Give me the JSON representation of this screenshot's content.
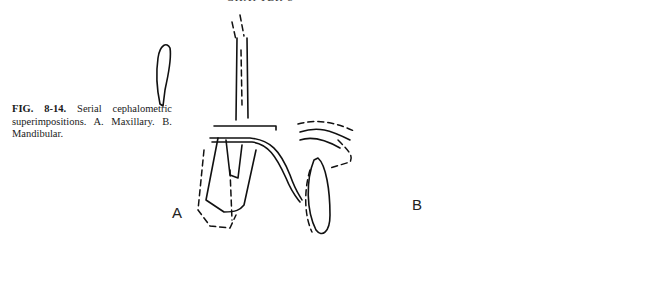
{
  "page": {
    "header_fragment": "CHAPTER 8"
  },
  "figure": {
    "number": "FIG. 8-14.",
    "caption_text": "Serial cephalometric superimpositions. A. Maxillary. B. Mandibular.",
    "panels": [
      {
        "label": "A",
        "description": "Maxillary superimposition"
      },
      {
        "label": "B",
        "description": "Mandibular superimposition"
      }
    ]
  }
}
